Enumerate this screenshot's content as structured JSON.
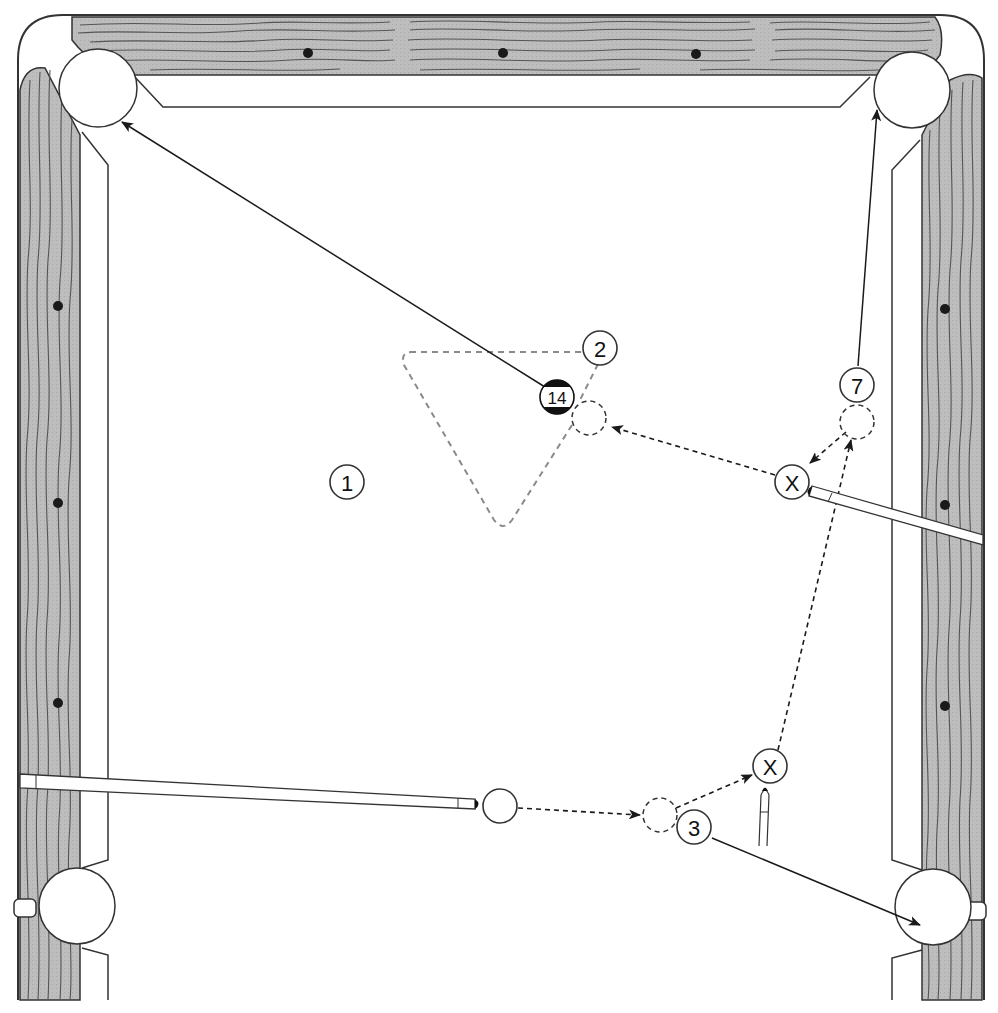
{
  "diagram": {
    "title": "",
    "colors": {
      "rail_wood": "#bdbdbd",
      "grain": "#555555",
      "outline": "#333333",
      "felt": "#ffffff",
      "rack_outline": "#8a8a8a",
      "diamond": "#1a1a1a",
      "stripe": "#111111"
    },
    "balls": [
      {
        "id": "ball-1",
        "label": "1",
        "x": 347,
        "y": 482
      },
      {
        "id": "ball-2",
        "label": "2",
        "x": 600,
        "y": 348
      },
      {
        "id": "ball-14",
        "label": "14",
        "x": 557,
        "y": 397,
        "striped": true
      },
      {
        "id": "ball-7",
        "label": "7",
        "x": 857,
        "y": 385
      },
      {
        "id": "ball-3",
        "label": "3",
        "x": 694,
        "y": 827
      },
      {
        "id": "cue-ball",
        "label": "",
        "x": 500,
        "y": 806
      }
    ],
    "position_markers": [
      {
        "id": "marker-x-1",
        "label": "X",
        "x": 792,
        "y": 482
      },
      {
        "id": "marker-x-2",
        "label": "X",
        "x": 770,
        "y": 766
      }
    ],
    "ghost_balls": [
      {
        "id": "ghost-14",
        "x": 589,
        "y": 418
      },
      {
        "id": "ghost-7",
        "x": 857,
        "y": 422
      },
      {
        "id": "ghost-3",
        "x": 660,
        "y": 815
      }
    ],
    "pockets": [
      {
        "id": "pocket-top-left",
        "x": 98,
        "y": 88
      },
      {
        "id": "pocket-top-right",
        "x": 912,
        "y": 90
      },
      {
        "id": "pocket-bottom-left",
        "x": 75,
        "y": 905
      },
      {
        "id": "pocket-bottom-right",
        "x": 933,
        "y": 907
      }
    ],
    "diamonds": [
      {
        "x": 308,
        "y": 53
      },
      {
        "x": 503,
        "y": 53
      },
      {
        "x": 696,
        "y": 54
      },
      {
        "x": 58,
        "y": 306
      },
      {
        "x": 58,
        "y": 503
      },
      {
        "x": 58,
        "y": 703
      },
      {
        "x": 945,
        "y": 309
      },
      {
        "x": 945,
        "y": 505
      },
      {
        "x": 945,
        "y": 706
      }
    ]
  }
}
